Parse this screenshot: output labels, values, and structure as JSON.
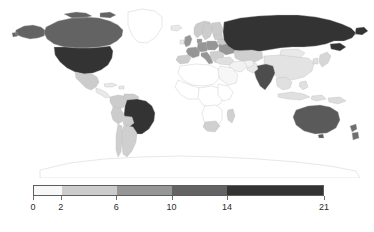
{
  "figure": {
    "kind": "choropleth-world-map",
    "background": "#ffffff"
  },
  "chart_data": {
    "type": "heatmap",
    "title": "",
    "subtitle": "",
    "xlabel": "",
    "ylabel": "",
    "projection": "equirectangular",
    "grid": false,
    "legend_position": "bottom",
    "colorbar": {
      "orientation": "horizontal",
      "discrete": true,
      "breaks": [
        0,
        2,
        6,
        10,
        14,
        21
      ],
      "tick_labels": [
        "0",
        "2",
        "6",
        "10",
        "14",
        "21"
      ],
      "range": [
        0,
        21
      ],
      "bands": [
        {
          "from": 0,
          "to": 2,
          "color": "#f7f7f7"
        },
        {
          "from": 2,
          "to": 6,
          "color": "#cccccc"
        },
        {
          "from": 6,
          "to": 10,
          "color": "#969696"
        },
        {
          "from": 10,
          "to": 14,
          "color": "#636363"
        },
        {
          "from": 14,
          "to": 21,
          "color": "#333333"
        }
      ],
      "border_color": "#5d5d5d",
      "tick_color": "#6f6f6f",
      "label_color": "#2b2b2b"
    },
    "no_data_color": "#ffffff",
    "border_color": "#b9b9b9",
    "categories": [
      "Russia",
      "United States",
      "Brazil",
      "Canada",
      "Australia",
      "India",
      "China",
      "Argentina",
      "Sweden",
      "Norway",
      "Finland",
      "Germany",
      "France",
      "United Kingdom",
      "Spain",
      "Italy",
      "Poland",
      "Ukraine",
      "Kazakhstan",
      "Mongolia",
      "Japan",
      "Mexico",
      "Chile",
      "Peru",
      "Colombia",
      "South Africa",
      "Madagascar",
      "New Zealand",
      "Greenland",
      "Turkey",
      "Iran",
      "Saudi Arabia",
      "Indonesia",
      "Algeria",
      "Egypt",
      "Nigeria",
      "Congo",
      "Sudan",
      "Libya",
      "Afghanistan",
      "Pakistan",
      "Thailand",
      "Vietnam",
      "Philippines",
      "Papua New Guinea",
      "Romania",
      "Belarus",
      "Bolivia",
      "Venezuela",
      "Greece"
    ],
    "values": [
      21,
      17,
      18,
      12,
      12,
      13,
      7,
      7,
      8,
      7,
      7,
      9,
      9,
      8,
      7,
      8,
      9,
      7,
      5,
      3,
      5,
      3,
      6,
      4,
      4,
      3,
      3,
      4,
      0,
      3,
      2,
      1,
      2,
      1,
      1,
      1,
      1,
      1,
      1,
      1,
      2,
      2,
      2,
      2,
      1,
      4,
      5,
      3,
      2,
      3
    ]
  },
  "map_regions": {
    "darkest_band_label": "14 – 21",
    "dark_band_label": "10 – 14",
    "mid_band_label": "6 – 10",
    "light_band_label": "2 – 6",
    "lightest_band_label": "0 – 2"
  }
}
